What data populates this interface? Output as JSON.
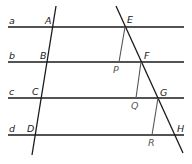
{
  "diagram": {
    "parallel_lines": [
      {
        "label": "a",
        "y": 27
      },
      {
        "label": "b",
        "y": 62
      },
      {
        "label": "c",
        "y": 98
      },
      {
        "label": "d",
        "y": 135
      }
    ],
    "left_transversal_points": [
      "A",
      "B",
      "C",
      "D"
    ],
    "right_transversal_points": [
      "E",
      "F",
      "G",
      "H"
    ],
    "auxiliary_points": [
      "P",
      "Q",
      "R"
    ],
    "auxiliary_segments": [
      "EP",
      "FQ",
      "GR"
    ]
  }
}
